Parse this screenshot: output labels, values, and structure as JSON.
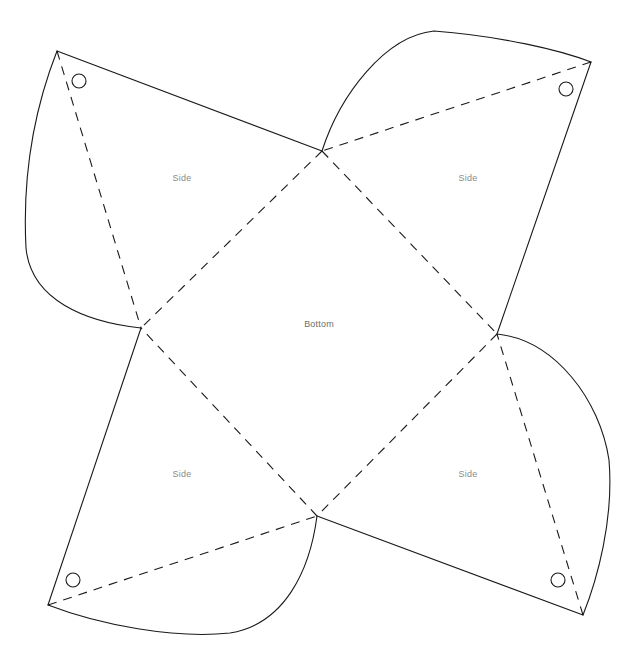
{
  "document": {
    "type": "papercraft-net-template",
    "title": "Four-sided box net",
    "background_color": "#ffffff",
    "line_color": "#1a1a1a",
    "fold_line_color": "#1a1a1a",
    "label_color": "#8a8a8a",
    "canvas": {
      "width": 638,
      "height": 667
    }
  },
  "labels": {
    "bottom": "Bottom",
    "side_top_left": "Side",
    "side_top_right": "Side",
    "side_bottom_left": "Side",
    "side_bottom_right": "Side"
  },
  "geometry": {
    "center_square": {
      "top": {
        "x": 322,
        "y": 151
      },
      "right": {
        "x": 497,
        "y": 334
      },
      "bottom": {
        "x": 317,
        "y": 516
      },
      "left": {
        "x": 141,
        "y": 328
      }
    },
    "outer_corners": {
      "top_left": {
        "x": 57,
        "y": 51
      },
      "top_right": {
        "x": 591,
        "y": 62
      },
      "bottom_right": {
        "x": 583,
        "y": 615
      },
      "bottom_left": {
        "x": 48,
        "y": 605
      }
    },
    "holes": [
      {
        "name": "hole-top-left",
        "cx": 79,
        "cy": 81,
        "r": 7
      },
      {
        "name": "hole-top-right",
        "cx": 566,
        "cy": 89,
        "r": 7
      },
      {
        "name": "hole-bottom-right",
        "cx": 558,
        "cy": 580,
        "r": 7
      },
      {
        "name": "hole-bottom-left",
        "cx": 73,
        "cy": 580,
        "r": 7
      }
    ],
    "label_positions": {
      "bottom": {
        "x": 319,
        "y": 325
      },
      "side_top_left": {
        "x": 182,
        "y": 179
      },
      "side_top_right": {
        "x": 468,
        "y": 179
      },
      "side_bottom_left": {
        "x": 182,
        "y": 475
      },
      "side_bottom_right": {
        "x": 468,
        "y": 475
      }
    },
    "solid_edges": [
      {
        "name": "edge-top-left-straight",
        "d": "M 57 51 L 322 151"
      },
      {
        "name": "edge-top-left-curve",
        "d": "M 57 51 C 30 120 23 190 26 248 C 31 300 85 322 141 328"
      },
      {
        "name": "edge-top-right-curve",
        "d": "M 322 151 C 340 95 385 36 434 31 C 500 36 560 50 591 62"
      },
      {
        "name": "edge-top-right-straight",
        "d": "M 591 62 L 497 334"
      },
      {
        "name": "edge-bottom-right-curve",
        "d": "M 497 334 C 555 340 600 400 609 460 C 614 520 597 580 583 615"
      },
      {
        "name": "edge-bottom-right-straight",
        "d": "M 583 615 L 317 516"
      },
      {
        "name": "edge-bottom-left-straight",
        "d": "M 141 328 L 48 605"
      },
      {
        "name": "edge-bottom-left-curve",
        "d": "M 48 605 C 100 625 175 639 230 633 C 285 624 310 570 317 516"
      }
    ],
    "fold_lines": [
      {
        "name": "fold-center-top-left",
        "d": "M 322 151 L 141 328"
      },
      {
        "name": "fold-center-top-right",
        "d": "M 322 151 L 497 334"
      },
      {
        "name": "fold-center-bottom-right",
        "d": "M 497 334 L 317 516"
      },
      {
        "name": "fold-center-bottom-left",
        "d": "M 317 516 L 141 328"
      },
      {
        "name": "fold-diagonal-top-left",
        "d": "M 57 51 L 141 328"
      },
      {
        "name": "fold-diagonal-top-right",
        "d": "M 591 62 L 322 151"
      },
      {
        "name": "fold-diagonal-bottom-right",
        "d": "M 583 615 L 497 334"
      },
      {
        "name": "fold-diagonal-bottom-left",
        "d": "M 48 605 L 317 516"
      }
    ],
    "dash_pattern": "9 7",
    "stroke_width": 1.1
  }
}
